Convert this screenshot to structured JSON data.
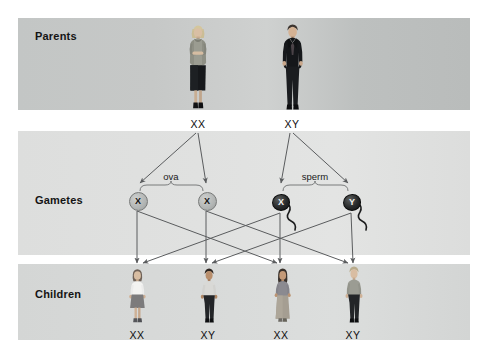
{
  "diagram": {
    "rows": [
      {
        "id": "parents",
        "label": "Parents"
      },
      {
        "id": "gametes",
        "label": "Gametes"
      },
      {
        "id": "children",
        "label": "Children"
      }
    ]
  },
  "parents": [
    {
      "id": "mother",
      "sex": "female",
      "genotype": "XX",
      "figure": "woman-standing-figure",
      "x": 198
    },
    {
      "id": "father",
      "sex": "male",
      "genotype": "XY",
      "figure": "man-in-suit-figure",
      "x": 292
    }
  ],
  "gametes": {
    "ova_label": "ova",
    "sperm_label": "sperm",
    "cells": [
      {
        "id": "ovum-1",
        "type": "ovum",
        "allele": "X",
        "x": 137
      },
      {
        "id": "ovum-2",
        "type": "ovum",
        "allele": "X",
        "x": 206
      },
      {
        "id": "sperm-1",
        "type": "sperm",
        "allele": "X",
        "x": 280
      },
      {
        "id": "sperm-2",
        "type": "sperm",
        "allele": "Y",
        "x": 351
      }
    ]
  },
  "children": [
    {
      "id": "child-1",
      "sex": "female",
      "genotype": "XX",
      "figure": "girl-figure",
      "x": 137
    },
    {
      "id": "child-2",
      "sex": "male",
      "genotype": "XY",
      "figure": "boy-figure",
      "x": 208
    },
    {
      "id": "child-3",
      "sex": "female",
      "genotype": "XX",
      "figure": "girl-long-skirt-figure",
      "x": 281
    },
    {
      "id": "child-4",
      "sex": "male",
      "genotype": "XY",
      "figure": "boy-tall-figure",
      "x": 353
    }
  ],
  "colors": {
    "band_parents": "#c6c8c7",
    "band_gametes": "#e0e1e0",
    "band_children": "#d8dad9",
    "arrow": "#5a5c5e",
    "text": "#111111",
    "page_background": "#ffffff"
  }
}
